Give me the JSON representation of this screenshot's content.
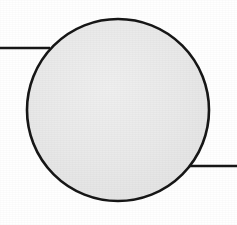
{
  "figure": {
    "background_color": "#ffffff",
    "canvas": {
      "width": 237,
      "height": 225
    },
    "shapes": {
      "circle": {
        "name": "Shaded circle",
        "center_x": 118,
        "center_y": 110,
        "radius": 91,
        "fill_color": "#e8e8e8",
        "stroke_color": "#161616",
        "stroke_width": 2.6
      },
      "leader_line_upper_left": {
        "name": "Upper-left leader line",
        "x1": 0,
        "y1": 48,
        "x2": 50,
        "y2": 48,
        "stroke_color": "#161616",
        "stroke_width": 2.4
      },
      "leader_line_lower_right": {
        "name": "Lower-right leader line",
        "x1": 187,
        "y1": 166,
        "x2": 237,
        "y2": 166,
        "stroke_color": "#161616",
        "stroke_width": 2.4
      }
    }
  }
}
